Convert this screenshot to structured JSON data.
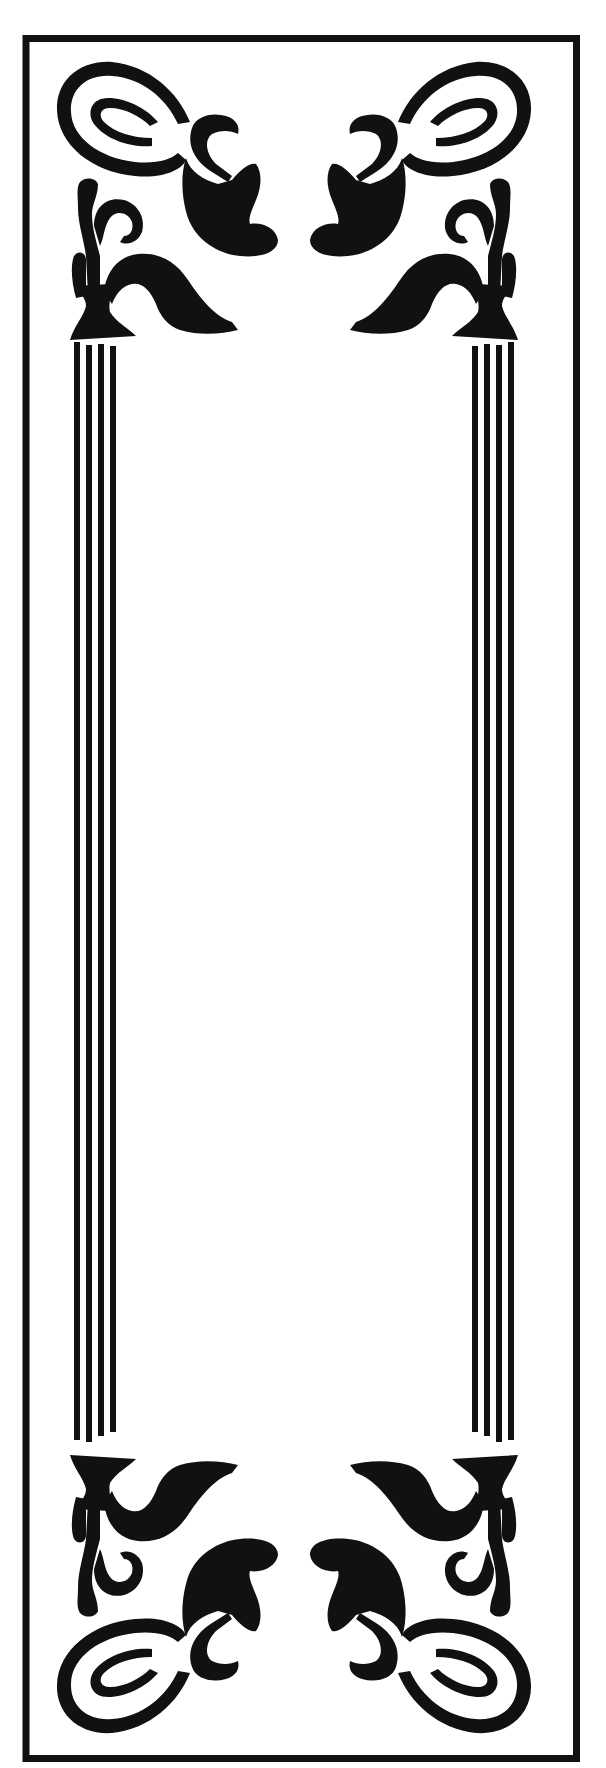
{
  "artwork": {
    "type": "decorative-border",
    "style": "art-nouveau",
    "orientation": "portrait",
    "ink_color": "#111111",
    "paper_color": "#ffffff",
    "outer_border": {
      "stroke_width": 7
    },
    "columns": {
      "count": 2,
      "lines_per_column": 4
    },
    "corner_ornaments": {
      "count": 4,
      "motif": "spiral-scroll-with-leaf-and-hook"
    },
    "center_content": ""
  }
}
